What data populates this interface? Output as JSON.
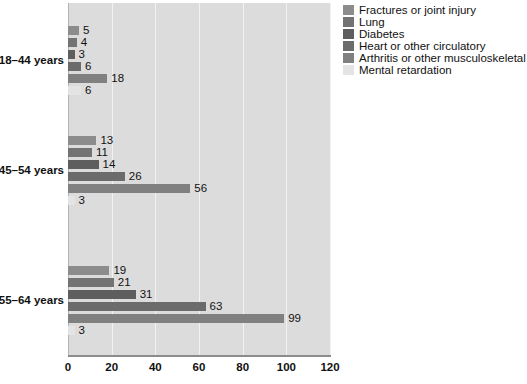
{
  "chart_data": {
    "type": "bar",
    "orientation": "horizontal",
    "title": "",
    "xlabel": "",
    "ylabel": "",
    "xlim": [
      0,
      120
    ],
    "xticks": [
      0,
      20,
      40,
      60,
      80,
      100,
      120
    ],
    "xtick_labels": [
      "0",
      "20",
      "40",
      "60",
      "80",
      "100",
      "120"
    ],
    "grid": true,
    "grid_axis": "x",
    "legend_position": "right",
    "categories": [
      "18–44 years",
      "45–54 years",
      "55–64 years"
    ],
    "series": [
      {
        "name": "Fractures or joint injury",
        "color": "#8c8c8c",
        "values": [
          5,
          13,
          19
        ],
        "labels": [
          "5",
          "13",
          "19"
        ]
      },
      {
        "name": "Lung",
        "color": "#737373",
        "values": [
          4,
          11,
          21
        ],
        "labels": [
          "4",
          "11",
          "21"
        ]
      },
      {
        "name": "Diabetes",
        "color": "#5e5e5e",
        "values": [
          3,
          14,
          31
        ],
        "labels": [
          "3",
          "14",
          "31"
        ]
      },
      {
        "name": "Heart or other circulatory",
        "color": "#6b6b6b",
        "values": [
          6,
          26,
          63
        ],
        "labels": [
          "6",
          "26",
          "63"
        ]
      },
      {
        "name": "Arthritis or other musculoskeletal",
        "color": "#808080",
        "values": [
          18,
          56,
          99
        ],
        "labels": [
          "18",
          "56",
          "99"
        ]
      },
      {
        "name": "Mental retardation",
        "color": "#e4e4e4",
        "values": [
          6,
          3,
          3
        ],
        "labels": [
          "6",
          "3",
          "3"
        ]
      }
    ]
  },
  "legend": {
    "items": [
      {
        "label": "Fractures or joint injury",
        "color": "#8c8c8c"
      },
      {
        "label": "Lung",
        "color": "#737373"
      },
      {
        "label": "Diabetes",
        "color": "#5e5e5e"
      },
      {
        "label": "Heart or other circulatory",
        "color": "#6b6b6b"
      },
      {
        "label": "Arthritis or other musculoskeletal",
        "color": "#808080"
      },
      {
        "label": "Mental retardation",
        "color": "#e4e4e4"
      }
    ]
  },
  "plot_style": {
    "background": "#dcdcdc",
    "gridline_color": "#f2f2f2",
    "axis_color": "#8c8c8c",
    "text_color": "#111111"
  }
}
